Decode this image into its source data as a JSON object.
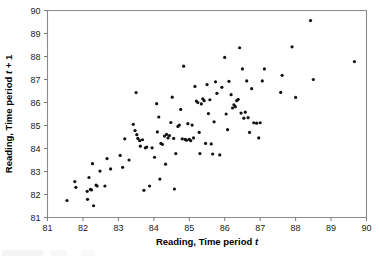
{
  "figure": {
    "background_color": "#ffffff",
    "frame_color": "#8a8a8a",
    "point_color": "#111111"
  },
  "chart_data": {
    "type": "scatter",
    "title": "",
    "xlabel": "Reading, Time period t",
    "ylabel": "Reading, Time period t + 1",
    "xlabel_plain": "Reading, Time period ",
    "xlabel_italic": "t",
    "ylabel_plain": "Reading, Time period ",
    "ylabel_italic": "t",
    "ylabel_suffix": " + 1",
    "xlim": [
      81,
      90
    ],
    "ylim": [
      81,
      90
    ],
    "xticks": [
      81,
      82,
      83,
      84,
      85,
      86,
      87,
      88,
      89,
      90
    ],
    "yticks": [
      81,
      82,
      83,
      84,
      85,
      86,
      87,
      88,
      89,
      90
    ],
    "xtick_labels": [
      "81",
      "82",
      "83",
      "84",
      "85",
      "86",
      "87",
      "88",
      "89",
      "90"
    ],
    "ytick_labels": [
      "81",
      "82",
      "83",
      "84",
      "85",
      "86",
      "87",
      "88",
      "89",
      "90"
    ],
    "grid": false,
    "legend": null,
    "marker": "filled-circle",
    "marker_size_px": 3.2,
    "n_points": 124,
    "points": [
      [
        81.55,
        81.74
      ],
      [
        81.77,
        82.56
      ],
      [
        81.8,
        82.31
      ],
      [
        82.12,
        82.14
      ],
      [
        82.13,
        81.79
      ],
      [
        82.17,
        82.74
      ],
      [
        82.21,
        82.22
      ],
      [
        82.24,
        82.2
      ],
      [
        82.27,
        83.34
      ],
      [
        82.3,
        81.51
      ],
      [
        82.37,
        82.41
      ],
      [
        82.4,
        82.37
      ],
      [
        82.48,
        83.02
      ],
      [
        82.62,
        82.37
      ],
      [
        82.68,
        83.56
      ],
      [
        82.78,
        83.11
      ],
      [
        83.05,
        83.7
      ],
      [
        83.12,
        83.18
      ],
      [
        83.18,
        84.42
      ],
      [
        83.3,
        83.5
      ],
      [
        83.42,
        85.05
      ],
      [
        83.47,
        84.78
      ],
      [
        83.5,
        86.43
      ],
      [
        83.52,
        84.6
      ],
      [
        83.55,
        84.44
      ],
      [
        83.6,
        84.34
      ],
      [
        83.62,
        84.1
      ],
      [
        83.68,
        84.38
      ],
      [
        83.72,
        82.18
      ],
      [
        83.76,
        84.03
      ],
      [
        83.8,
        84.06
      ],
      [
        83.88,
        82.37
      ],
      [
        83.95,
        84.03
      ],
      [
        84.02,
        83.62
      ],
      [
        84.08,
        85.95
      ],
      [
        84.1,
        84.72
      ],
      [
        84.14,
        85.37
      ],
      [
        84.17,
        82.67
      ],
      [
        84.2,
        84.22
      ],
      [
        84.24,
        84.18
      ],
      [
        84.3,
        84.54
      ],
      [
        84.33,
        83.32
      ],
      [
        84.36,
        84.61
      ],
      [
        84.4,
        84.46
      ],
      [
        84.44,
        84.56
      ],
      [
        84.48,
        85.13
      ],
      [
        84.52,
        86.23
      ],
      [
        84.56,
        84.44
      ],
      [
        84.58,
        82.24
      ],
      [
        84.62,
        83.78
      ],
      [
        84.68,
        84.96
      ],
      [
        84.72,
        85.02
      ],
      [
        84.76,
        85.7
      ],
      [
        84.8,
        84.42
      ],
      [
        84.84,
        87.58
      ],
      [
        84.88,
        84.4
      ],
      [
        84.92,
        84.36
      ],
      [
        84.96,
        85.08
      ],
      [
        85.0,
        84.4
      ],
      [
        85.04,
        84.34
      ],
      [
        85.08,
        85.02
      ],
      [
        85.12,
        84.46
      ],
      [
        85.16,
        86.7
      ],
      [
        85.2,
        86.06
      ],
      [
        85.24,
        86.0
      ],
      [
        85.28,
        84.7
      ],
      [
        85.3,
        83.78
      ],
      [
        85.34,
        85.94
      ],
      [
        85.38,
        86.16
      ],
      [
        85.42,
        86.08
      ],
      [
        85.46,
        84.22
      ],
      [
        85.5,
        86.78
      ],
      [
        85.54,
        85.52
      ],
      [
        85.58,
        86.12
      ],
      [
        85.62,
        84.2
      ],
      [
        85.66,
        83.76
      ],
      [
        85.7,
        85.16
      ],
      [
        85.74,
        86.9
      ],
      [
        85.78,
        86.4
      ],
      [
        85.86,
        83.72
      ],
      [
        85.92,
        86.66
      ],
      [
        86.0,
        87.96
      ],
      [
        86.04,
        85.5
      ],
      [
        86.08,
        84.82
      ],
      [
        86.12,
        86.92
      ],
      [
        86.18,
        86.34
      ],
      [
        86.22,
        85.76
      ],
      [
        86.26,
        85.9
      ],
      [
        86.3,
        85.82
      ],
      [
        86.34,
        86.08
      ],
      [
        86.38,
        86.14
      ],
      [
        86.42,
        88.38
      ],
      [
        86.46,
        85.54
      ],
      [
        86.5,
        87.46
      ],
      [
        86.54,
        85.32
      ],
      [
        86.58,
        85.58
      ],
      [
        86.62,
        86.94
      ],
      [
        86.66,
        85.34
      ],
      [
        86.7,
        84.7
      ],
      [
        86.76,
        86.6
      ],
      [
        86.82,
        85.12
      ],
      [
        86.9,
        85.1
      ],
      [
        86.96,
        84.46
      ],
      [
        87.0,
        85.12
      ],
      [
        87.06,
        86.94
      ],
      [
        87.12,
        87.46
      ],
      [
        87.58,
        86.44
      ],
      [
        87.62,
        87.18
      ],
      [
        87.9,
        88.42
      ],
      [
        88.0,
        86.22
      ],
      [
        88.42,
        89.56
      ],
      [
        88.5,
        87.0
      ],
      [
        89.66,
        87.78
      ]
    ]
  }
}
